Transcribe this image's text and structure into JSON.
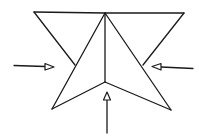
{
  "diagram": {
    "type": "origami-fold-step",
    "colors": {
      "line": "#1a1a1a",
      "background": "#ffffff"
    },
    "shapes": {
      "top_edge": [
        [
          34,
          12
        ],
        [
          184,
          13
        ]
      ],
      "left_flap": [
        [
          34,
          12
        ],
        [
          75,
          65
        ]
      ],
      "right_flap": [
        [
          184,
          13
        ],
        [
          143,
          65
        ]
      ],
      "center_crease": [
        [
          105,
          13
        ],
        [
          105,
          82
        ]
      ],
      "left_arm_outer": [
        [
          105,
          13
        ],
        [
          52,
          109
        ]
      ],
      "left_arm_inner": [
        [
          105,
          82
        ],
        [
          52,
          109
        ]
      ],
      "right_arm_outer": [
        [
          105,
          13
        ],
        [
          171,
          110
        ]
      ],
      "right_arm_inner": [
        [
          105,
          82
        ],
        [
          171,
          110
        ]
      ]
    },
    "arrows": [
      {
        "name": "push-left-arrow",
        "direction": "right",
        "from": [
          14,
          65
        ],
        "to": [
          54,
          67
        ]
      },
      {
        "name": "push-right-arrow",
        "direction": "left",
        "from": [
          193,
          68
        ],
        "to": [
          152,
          66
        ]
      },
      {
        "name": "push-bottom-arrow",
        "direction": "up",
        "from": [
          107,
          133
        ],
        "to": [
          107,
          92
        ]
      }
    ]
  }
}
